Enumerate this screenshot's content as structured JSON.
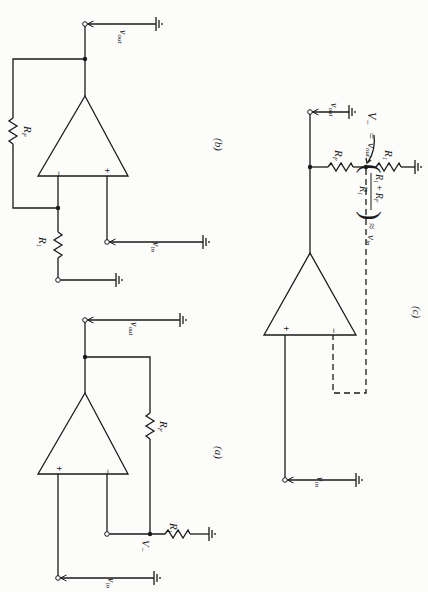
{
  "figure": {
    "orientation": "rotated 90 degrees clockwise",
    "panels": [
      {
        "id": "b",
        "caption": "(b)",
        "labels": {
          "feedback_resistor": "R",
          "feedback_sub": "F",
          "input_resistor": "R",
          "input_sub": "1",
          "input": "v",
          "input_sub_text": "in",
          "output": "v",
          "output_sub_text": "out"
        },
        "signs": {
          "minus": "−",
          "plus": "+"
        }
      },
      {
        "id": "a",
        "caption": "(a)",
        "labels": {
          "feedback_resistor": "R",
          "feedback_sub": "F",
          "input_resistor": "R",
          "input_sub": "1",
          "input": "v",
          "input_sub_text": "in",
          "output": "v",
          "output_sub_text": "out",
          "node": "V",
          "node_sub": "−"
        },
        "signs": {
          "minus": "−",
          "plus": "+"
        }
      },
      {
        "id": "c",
        "caption": "(c)",
        "labels": {
          "feedback_resistor": "R",
          "feedback_sub": "F",
          "input_resistor": "R",
          "input_sub": "1",
          "input": "v",
          "input_sub_text": "in",
          "output": "v",
          "output_sub_text": "out",
          "node": "V",
          "node_sub": "−"
        },
        "signs": {
          "minus": "−",
          "plus": "+"
        },
        "equation": {
          "lhs": "V",
          "lhs_sub": "−",
          "eq1": "=",
          "vout": "v",
          "vout_sub": "out",
          "numerator": "R",
          "num_sub1": "1",
          "num_plus": "+",
          "num_r2": "R",
          "num_sub2": "F",
          "denominator": "R",
          "den_sub": "1",
          "approx": "≈",
          "rhs": "v",
          "rhs_sub": "in"
        }
      }
    ]
  }
}
